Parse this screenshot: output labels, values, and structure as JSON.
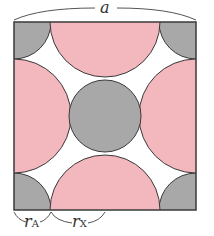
{
  "diagram": {
    "title_label": "a",
    "labels": {
      "rA": "r",
      "rA_sub": "A",
      "rX": "r",
      "rX_sub": "X"
    },
    "colors": {
      "anion": "#f2b8bd",
      "cation": "#a8a8a8",
      "stroke": "#3a3a3a",
      "background": "#ffffff"
    }
  }
}
